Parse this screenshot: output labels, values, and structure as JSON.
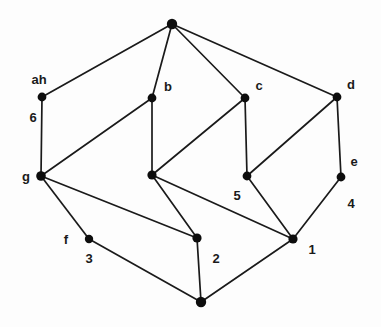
{
  "diagram": {
    "type": "undirected-graph",
    "title": "",
    "background_color": "#fdfdfd",
    "edge_color": "#1a1a1a",
    "node_color": "#0d0d0d",
    "label_color": "#1a1a1a",
    "node_radius": 4.4,
    "edge_width": 1.7,
    "nodes": [
      {
        "id": "top",
        "label": "",
        "x": 172,
        "y": 24,
        "label_x": 172,
        "label_y": 24,
        "r": 5.2
      },
      {
        "id": "ah",
        "label": "ah",
        "x": 42,
        "y": 97,
        "label_x": 39,
        "label_y": 79,
        "r": 4.4
      },
      {
        "id": "b",
        "label": "b",
        "x": 152,
        "y": 98,
        "label_x": 168,
        "label_y": 86,
        "r": 4.4
      },
      {
        "id": "c",
        "label": "c",
        "x": 245,
        "y": 98,
        "label_x": 259,
        "label_y": 85,
        "r": 4.4
      },
      {
        "id": "d",
        "label": "d",
        "x": 337,
        "y": 97,
        "label_x": 351,
        "label_y": 84,
        "r": 4.4
      },
      {
        "id": "six",
        "label": "6",
        "x": 42,
        "y": 176,
        "label_x": 33,
        "label_y": 117,
        "r": 0
      },
      {
        "id": "g",
        "label": "g",
        "x": 41,
        "y": 176,
        "label_x": 26,
        "label_y": 176,
        "r": 4.8
      },
      {
        "id": "mid",
        "label": "",
        "x": 152,
        "y": 175,
        "label_x": 152,
        "label_y": 175,
        "r": 4.6
      },
      {
        "id": "five",
        "label": "5",
        "x": 247,
        "y": 176,
        "label_x": 237,
        "label_y": 195,
        "r": 4.4
      },
      {
        "id": "e",
        "label": "e",
        "x": 341,
        "y": 177,
        "label_x": 354,
        "label_y": 161,
        "r": 4.4
      },
      {
        "id": "four",
        "label": "4",
        "x": 341,
        "y": 177,
        "label_x": 351,
        "label_y": 203,
        "r": 0
      },
      {
        "id": "f3",
        "label": "3",
        "x": 89,
        "y": 239,
        "label_x": 89,
        "label_y": 258,
        "r": 4.2
      },
      {
        "id": "f",
        "label": "f",
        "x": 89,
        "y": 239,
        "label_x": 66,
        "label_y": 239,
        "r": 0
      },
      {
        "id": "two",
        "label": "2",
        "x": 197,
        "y": 238,
        "label_x": 216,
        "label_y": 258,
        "r": 4.6
      },
      {
        "id": "one",
        "label": "1",
        "x": 293,
        "y": 239,
        "label_x": 312,
        "label_y": 249,
        "r": 4.6
      },
      {
        "id": "bottom",
        "label": "",
        "x": 201,
        "y": 302,
        "label_x": 201,
        "label_y": 302,
        "r": 5.2
      }
    ],
    "edges": [
      {
        "from": "top",
        "to": "ah"
      },
      {
        "from": "top",
        "to": "b"
      },
      {
        "from": "top",
        "to": "c"
      },
      {
        "from": "top",
        "to": "d"
      },
      {
        "from": "ah",
        "to": "g"
      },
      {
        "from": "g",
        "to": "b"
      },
      {
        "from": "g",
        "to": "two"
      },
      {
        "from": "g",
        "to": "f3"
      },
      {
        "from": "b",
        "to": "mid"
      },
      {
        "from": "c",
        "to": "mid"
      },
      {
        "from": "c",
        "to": "five"
      },
      {
        "from": "d",
        "to": "five"
      },
      {
        "from": "d",
        "to": "e"
      },
      {
        "from": "mid",
        "to": "two"
      },
      {
        "from": "mid",
        "to": "one"
      },
      {
        "from": "five",
        "to": "one"
      },
      {
        "from": "e",
        "to": "one"
      },
      {
        "from": "f3",
        "to": "bottom"
      },
      {
        "from": "two",
        "to": "bottom"
      },
      {
        "from": "one",
        "to": "bottom"
      }
    ],
    "vertex_labels": [
      "ah",
      "b",
      "c",
      "d",
      "g",
      "e",
      "f"
    ],
    "numeric_labels": [
      "6",
      "5",
      "4",
      "3",
      "2",
      "1"
    ]
  }
}
